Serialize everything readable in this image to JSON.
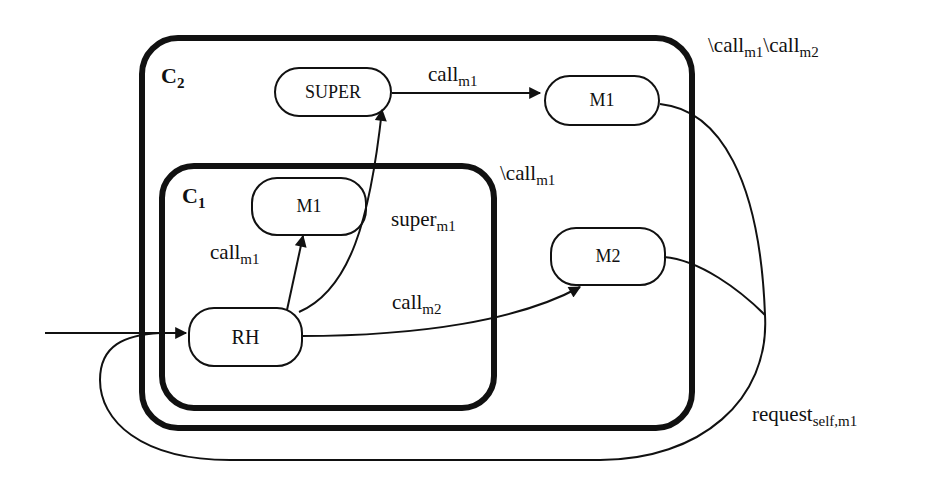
{
  "diagram": {
    "type": "statechart",
    "containers": [
      {
        "id": "C2",
        "name": "C",
        "sub": "2",
        "annotation_main": "\\call",
        "annotation_sub1": "m1",
        "annotation_mid": "\\call",
        "annotation_sub2": "m2"
      },
      {
        "id": "C1",
        "name": "C",
        "sub": "1",
        "annotation_main": "\\call",
        "annotation_sub": "m1"
      }
    ],
    "states": {
      "super": {
        "label": "SUPER"
      },
      "m1_outer": {
        "label": "M1"
      },
      "m1_inner": {
        "label": "M1"
      },
      "m2": {
        "label": "M2"
      },
      "rh": {
        "label": "RH"
      }
    },
    "transitions": {
      "super_to_m1": {
        "label": "call",
        "sub": "m1"
      },
      "rh_to_m1": {
        "label": "call",
        "sub": "m1"
      },
      "rh_to_super": {
        "label": "super",
        "sub": "m1"
      },
      "rh_to_m2": {
        "label": "call",
        "sub": "m2"
      },
      "return_to_rh": {
        "label": "request",
        "sub": "self,m1"
      }
    },
    "colors": {
      "stroke": "#111111",
      "background": "#ffffff"
    }
  }
}
